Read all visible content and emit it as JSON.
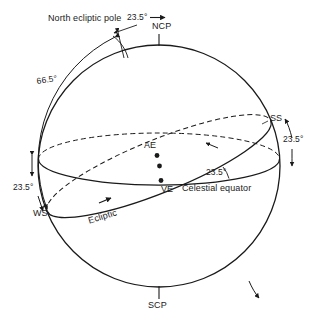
{
  "diagram": {
    "labels": {
      "north_ecliptic_pole": "North ecliptic pole",
      "ncp": "NCP",
      "scp": "SCP",
      "ss": "SS",
      "ws": "WS",
      "ae": "AE",
      "ve": "VE",
      "ecliptic": "Ecliptic",
      "celestial_equator": "Celestial equator"
    },
    "angles": {
      "tilt_top": "23.5°",
      "tilt_right": "23.5°",
      "tilt_left": "23.5°",
      "tilt_center": "23.5°",
      "obliquity_complement": "66.5°"
    },
    "colors": {
      "stroke": "#1a1a1a",
      "background": "#ffffff",
      "text": "#1a1a1a"
    },
    "geometry": {
      "center_x": 159,
      "center_y": 166,
      "radius": 121
    }
  }
}
